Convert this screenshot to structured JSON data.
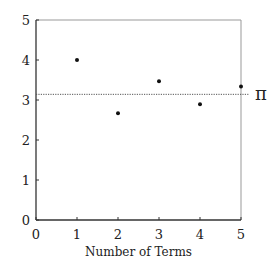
{
  "chart_data": {
    "type": "scatter",
    "title": "",
    "xlabel": "Number of Terms",
    "ylabel": "",
    "xlim": [
      0,
      5
    ],
    "ylim": [
      0,
      5
    ],
    "x_ticks": [
      "0",
      "1",
      "2",
      "3",
      "4",
      "5"
    ],
    "y_ticks": [
      "0",
      "1",
      "2",
      "3",
      "4",
      "5"
    ],
    "grid": false,
    "series": [
      {
        "name": "partial sums",
        "x": [
          1,
          2,
          3,
          4,
          5
        ],
        "values": [
          4.0,
          2.667,
          3.467,
          2.895,
          3.34
        ]
      }
    ],
    "reference_line": {
      "label": "π",
      "value": 3.14159,
      "style": "dotted"
    }
  }
}
